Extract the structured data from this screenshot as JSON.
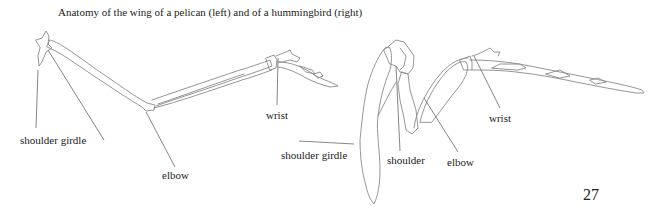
{
  "figure": {
    "caption": "Anatomy of the wing of a pelican (left) and of a hummingbird (right)",
    "pelican": {
      "labels": {
        "shoulder_girdle": "shoulder girdle",
        "elbow": "elbow",
        "wrist": "wrist"
      }
    },
    "hummingbird": {
      "labels": {
        "shoulder_girdle": "shoulder girdle",
        "shoulder": "shoulder",
        "elbow": "elbow",
        "wrist": "wrist"
      }
    }
  },
  "page": {
    "number": "27"
  }
}
